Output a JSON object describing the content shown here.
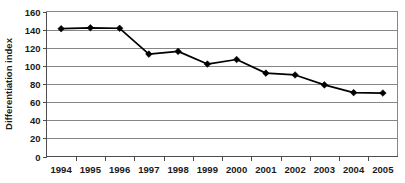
{
  "chart_data": {
    "type": "line",
    "title": "",
    "xlabel": "",
    "ylabel": "Differentiation index",
    "categories": [
      "1994",
      "1995",
      "1996",
      "1997",
      "1998",
      "1999",
      "2000",
      "2001",
      "2002",
      "2003",
      "2004",
      "2005"
    ],
    "values": [
      141,
      142,
      141.5,
      113,
      116,
      102,
      107,
      92,
      90,
      79,
      70.5,
      70
    ],
    "series": [
      {
        "name": "Differentiation index",
        "values": [
          141,
          142,
          141.5,
          113,
          116,
          102,
          107,
          92,
          90,
          79,
          70.5,
          70
        ]
      }
    ],
    "ylim": [
      0,
      160
    ],
    "ytick_step": 20,
    "yticks": [
      "0",
      "20",
      "40",
      "60",
      "80",
      "100",
      "120",
      "140",
      "160"
    ],
    "xticks": [
      "1994",
      "1995",
      "1996",
      "1997",
      "1998",
      "1999",
      "2000",
      "2001",
      "2002",
      "2003",
      "2004",
      "2005"
    ],
    "grid": "horizontal",
    "legend": "none",
    "marker": "diamond",
    "line_color": "#000000",
    "grid_color": "#868686",
    "background_color": "#ffffff",
    "axis_text_color": "#1a1a1a"
  }
}
